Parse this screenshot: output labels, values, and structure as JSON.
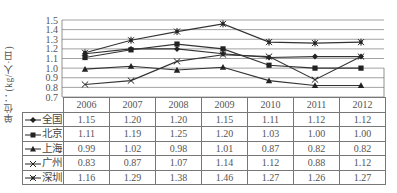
{
  "chart_data": {
    "type": "line",
    "title": "",
    "xlabel": "",
    "ylabel": "单位：(kg/人·日)",
    "ylim": [
      0.7,
      1.5
    ],
    "yticks": [
      "0.7",
      "0.8",
      "0.9",
      "1.0",
      "1.1",
      "1.2",
      "1.3",
      "1.4",
      "1.5"
    ],
    "grid": true,
    "legend": "data-table-left",
    "categories": [
      "2006",
      "2007",
      "2008",
      "2009",
      "2010",
      "2011",
      "2012"
    ],
    "series": [
      {
        "name": "全国",
        "marker": "diamond",
        "values": [
          1.15,
          1.2,
          1.2,
          1.15,
          1.11,
          1.12,
          1.12
        ]
      },
      {
        "name": "北京",
        "marker": "square",
        "values": [
          1.11,
          1.19,
          1.25,
          1.2,
          1.03,
          1.0,
          1.0
        ]
      },
      {
        "name": "上海",
        "marker": "triangle",
        "values": [
          0.99,
          1.02,
          0.98,
          1.01,
          0.87,
          0.82,
          0.82
        ]
      },
      {
        "name": "广州",
        "marker": "x",
        "values": [
          0.83,
          0.87,
          1.07,
          1.14,
          1.12,
          0.88,
          1.12
        ]
      },
      {
        "name": "深圳",
        "marker": "star",
        "values": [
          1.16,
          1.29,
          1.38,
          1.46,
          1.27,
          1.26,
          1.27
        ]
      }
    ],
    "value_labels": {
      "全国": [
        "1.15",
        "1.20",
        "1.20",
        "1.15",
        "1.11",
        "1.12",
        "1.12"
      ],
      "北京": [
        "1.11",
        "1.19",
        "1.25",
        "1.20",
        "1.03",
        "1.00",
        "1.00"
      ],
      "上海": [
        "0.99",
        "1.02",
        "0.98",
        "1.01",
        "0.87",
        "0.82",
        "0.82"
      ],
      "广州": [
        "0.83",
        "0.87",
        "1.07",
        "1.14",
        "1.12",
        "0.88",
        "1.12"
      ],
      "深圳": [
        "1.16",
        "1.29",
        "1.38",
        "1.46",
        "1.27",
        "1.26",
        "1.27"
      ]
    }
  }
}
